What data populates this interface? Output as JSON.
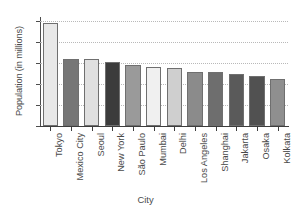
{
  "chart_data": {
    "type": "bar",
    "title": "",
    "xlabel": "City",
    "ylabel": "Population (in millions)",
    "categories": [
      "Tokyo",
      "Mexico City",
      "Seoul",
      "New York",
      "São Paulo",
      "Mumbai",
      "Delhi",
      "Los Angeles",
      "Shanghai",
      "Jakarta",
      "Osaka",
      "Kolkata"
    ],
    "values": [
      34.5,
      22.5,
      22.2,
      21.4,
      20.3,
      19.6,
      19.3,
      18.0,
      17.9,
      17.5,
      16.8,
      15.6
    ],
    "ylim": [
      0,
      36
    ],
    "yticks": [
      0,
      7,
      14,
      21,
      28,
      35
    ],
    "ytick_labels": [
      "0",
      "7",
      "14",
      "21",
      "28",
      "35"
    ],
    "grid": true,
    "legend": "none",
    "bar_colors": [
      "#e8e8e8",
      "#767676",
      "#e0e0e0",
      "#3c3c3c",
      "#9a9a9a",
      "#f0f0f0",
      "#cfcfcf",
      "#8b8b8b",
      "#6e6e6e",
      "#5a5a5a",
      "#515151",
      "#8f8f8f"
    ]
  }
}
